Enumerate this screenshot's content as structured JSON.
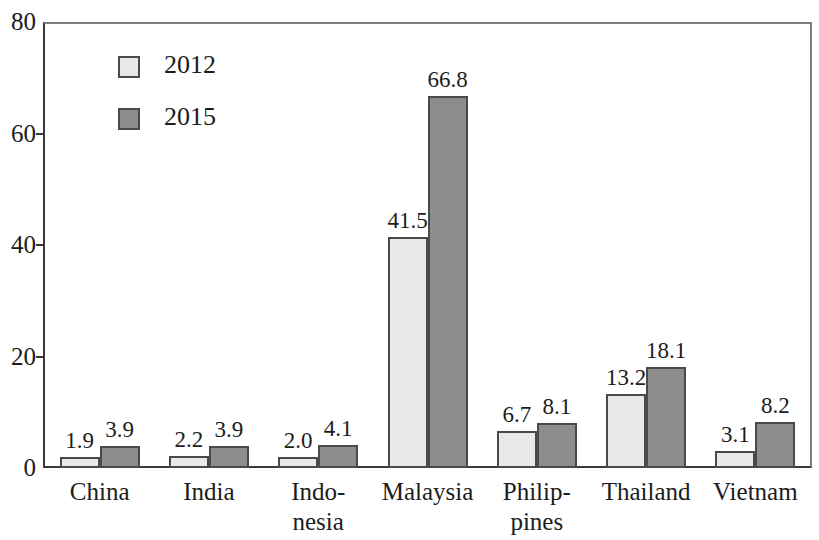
{
  "chart_data": {
    "type": "bar",
    "title": "",
    "subtitle": "",
    "xlabel": "",
    "ylabel": "",
    "ylim": [
      0,
      80
    ],
    "yticks": [
      0,
      20,
      40,
      60,
      80
    ],
    "grid": false,
    "legend_position": "upper-left-inside",
    "categories": [
      "China",
      "India",
      "Indonesia",
      "Malaysia",
      "Philippines",
      "Thailand",
      "Vietnam"
    ],
    "category_label_lines": [
      [
        "China"
      ],
      [
        "India"
      ],
      [
        "Indo-",
        "nesia"
      ],
      [
        "Malaysia"
      ],
      [
        "Philip-",
        "pines"
      ],
      [
        "Thailand"
      ],
      [
        "Vietnam"
      ]
    ],
    "series": [
      {
        "name": "2012",
        "color": "#e9e9e9",
        "values": [
          1.9,
          2.2,
          2.0,
          41.5,
          6.7,
          13.2,
          3.1
        ],
        "labels": [
          "1.9",
          "2.2",
          "2.0",
          "41.5",
          "6.7",
          "13.2",
          "3.1"
        ]
      },
      {
        "name": "2015",
        "color": "#8d8d8d",
        "values": [
          3.9,
          3.9,
          4.1,
          66.8,
          8.1,
          18.1,
          8.2
        ],
        "labels": [
          "3.9",
          "3.9",
          "4.1",
          "66.8",
          "8.1",
          "18.1",
          "8.2"
        ]
      }
    ]
  },
  "axis": {
    "y_tick_labels": [
      "0",
      "20",
      "40",
      "60",
      "80"
    ]
  },
  "legend": {
    "items": [
      {
        "label": "2012"
      },
      {
        "label": "2015"
      }
    ]
  },
  "colors": {
    "series_2012": "#e9e9e9",
    "series_2015": "#8d8d8d",
    "bar_border": "#4a4a4a",
    "axis": "#3a3a3a",
    "text": "#1c1c1c",
    "background": "#ffffff"
  }
}
